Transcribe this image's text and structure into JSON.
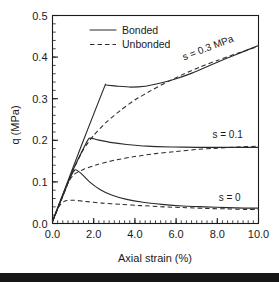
{
  "chart_data": {
    "type": "line",
    "title": "",
    "xlabel": "Axial strain (%)",
    "ylabel": "q (MPa)",
    "xlim": [
      0.0,
      10.0
    ],
    "ylim": [
      0.0,
      0.5
    ],
    "xticks": [
      "0.0",
      "2.0",
      "4.0",
      "6.0",
      "8.0",
      "10.0"
    ],
    "yticks": [
      "0.0",
      "0.1",
      "0.2",
      "0.3",
      "0.4",
      "0.5"
    ],
    "xtick_values": [
      0.0,
      2.0,
      4.0,
      6.0,
      8.0,
      10.0
    ],
    "ytick_values": [
      0.0,
      0.1,
      0.2,
      0.3,
      0.4,
      0.5
    ],
    "x_minor_interval": 0.25,
    "y_minor_interval": 0.02,
    "grid": false,
    "legend_position": "top-center",
    "legend": [
      {
        "label": "Bonded",
        "style": "solid"
      },
      {
        "label": "Unbonded",
        "style": "dashed"
      }
    ],
    "annotations": [
      {
        "text": "s = 0.3 MPa",
        "x": 7.6,
        "y": 0.415,
        "rotation": -21
      },
      {
        "text": "s = 0.1",
        "x": 8.5,
        "y": 0.205,
        "rotation": 0
      },
      {
        "text": "s = 0",
        "x": 8.6,
        "y": 0.055,
        "rotation": 0
      }
    ],
    "series": [
      {
        "name": "s = 0.3 MPa Bonded",
        "style": "solid",
        "points": [
          [
            0.0,
            0.005
          ],
          [
            0.4,
            0.057
          ],
          [
            0.9,
            0.122
          ],
          [
            1.4,
            0.187
          ],
          [
            2.0,
            0.263
          ],
          [
            2.55,
            0.332
          ],
          [
            2.6,
            0.333
          ],
          [
            3.2,
            0.33
          ],
          [
            3.8,
            0.328
          ],
          [
            4.5,
            0.33
          ],
          [
            5.2,
            0.337
          ],
          [
            6.0,
            0.348
          ],
          [
            6.8,
            0.362
          ],
          [
            7.6,
            0.379
          ],
          [
            8.4,
            0.396
          ],
          [
            9.2,
            0.412
          ],
          [
            10.0,
            0.428
          ]
        ]
      },
      {
        "name": "s = 0.3 MPa Unbonded",
        "style": "dashed",
        "points": [
          [
            0.0,
            0.005
          ],
          [
            0.5,
            0.065
          ],
          [
            1.0,
            0.128
          ],
          [
            1.5,
            0.178
          ],
          [
            2.0,
            0.212
          ],
          [
            2.6,
            0.243
          ],
          [
            3.3,
            0.272
          ],
          [
            4.0,
            0.297
          ],
          [
            4.8,
            0.32
          ],
          [
            5.6,
            0.341
          ],
          [
            6.4,
            0.36
          ],
          [
            7.2,
            0.377
          ],
          [
            8.0,
            0.392
          ],
          [
            8.8,
            0.406
          ],
          [
            9.4,
            0.416
          ],
          [
            10.0,
            0.426
          ]
        ]
      },
      {
        "name": "s = 0.1 Bonded",
        "style": "solid",
        "points": [
          [
            0.0,
            0.005
          ],
          [
            0.5,
            0.066
          ],
          [
            1.0,
            0.129
          ],
          [
            1.5,
            0.18
          ],
          [
            1.78,
            0.205
          ],
          [
            2.2,
            0.201
          ],
          [
            2.8,
            0.195
          ],
          [
            3.6,
            0.19
          ],
          [
            4.6,
            0.186
          ],
          [
            5.8,
            0.184
          ],
          [
            7.0,
            0.183
          ],
          [
            8.2,
            0.183
          ],
          [
            9.2,
            0.183
          ],
          [
            10.0,
            0.183
          ]
        ]
      },
      {
        "name": "s = 0.1 Unbonded",
        "style": "dashed",
        "points": [
          [
            0.0,
            0.005
          ],
          [
            0.35,
            0.05
          ],
          [
            0.75,
            0.098
          ],
          [
            1.05,
            0.118
          ],
          [
            1.5,
            0.13
          ],
          [
            2.2,
            0.142
          ],
          [
            3.0,
            0.152
          ],
          [
            4.0,
            0.161
          ],
          [
            5.0,
            0.168
          ],
          [
            6.0,
            0.173
          ],
          [
            7.0,
            0.178
          ],
          [
            8.0,
            0.181
          ],
          [
            9.0,
            0.184
          ],
          [
            10.0,
            0.186
          ]
        ]
      },
      {
        "name": "s = 0 Bonded",
        "style": "solid",
        "points": [
          [
            0.0,
            0.005
          ],
          [
            0.4,
            0.056
          ],
          [
            0.8,
            0.104
          ],
          [
            1.1,
            0.129
          ],
          [
            1.4,
            0.12
          ],
          [
            1.8,
            0.1
          ],
          [
            2.3,
            0.082
          ],
          [
            2.9,
            0.068
          ],
          [
            3.6,
            0.058
          ],
          [
            4.4,
            0.051
          ],
          [
            5.3,
            0.046
          ],
          [
            6.3,
            0.042
          ],
          [
            7.4,
            0.04
          ],
          [
            8.5,
            0.038
          ],
          [
            9.3,
            0.037
          ],
          [
            10.0,
            0.037
          ]
        ]
      },
      {
        "name": "s = 0 Unbonded",
        "style": "dashed",
        "points": [
          [
            0.0,
            0.005
          ],
          [
            0.3,
            0.04
          ],
          [
            0.6,
            0.054
          ],
          [
            1.0,
            0.056
          ],
          [
            1.6,
            0.053
          ],
          [
            2.4,
            0.049
          ],
          [
            3.3,
            0.046
          ],
          [
            4.3,
            0.043
          ],
          [
            5.4,
            0.04
          ],
          [
            6.5,
            0.038
          ],
          [
            7.6,
            0.036
          ],
          [
            8.6,
            0.035
          ],
          [
            9.3,
            0.034
          ],
          [
            10.0,
            0.034
          ]
        ]
      }
    ]
  },
  "colors": {
    "background": "#ffffff",
    "ink": "#1a1a1a",
    "curve": "#2b2b2b",
    "bottom_band": "#161616"
  }
}
